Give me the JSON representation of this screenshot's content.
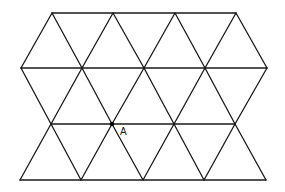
{
  "diagram": {
    "type": "triangular-grid",
    "line_color": "#1a1a1a",
    "background": "#ffffff",
    "rows": [
      {
        "y": 13,
        "x": [
          52,
          113,
          175,
          236
        ]
      },
      {
        "y": 68,
        "x": [
          21,
          82,
          144,
          205,
          267
        ]
      },
      {
        "y": 124,
        "x": [
          51,
          112,
          174,
          235
        ]
      },
      {
        "y": 180,
        "x": [
          20,
          81,
          143,
          204,
          266
        ]
      }
    ],
    "labeled_points": [
      {
        "label": "A",
        "x": 112,
        "y": 124,
        "label_x": 120,
        "label_y": 135
      }
    ]
  }
}
